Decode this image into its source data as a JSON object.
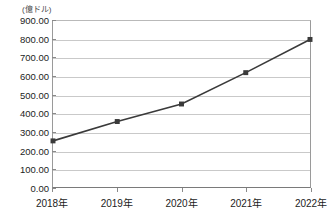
{
  "chart_data": {
    "type": "line",
    "title": "",
    "subtitle": "",
    "xlabel": "",
    "ylabel": "",
    "unit_label": "(億ドル)",
    "categories": [
      "2018年",
      "2019年",
      "2020年",
      "2021年",
      "2022年"
    ],
    "values": [
      250,
      355,
      450,
      620,
      800
    ],
    "series": [
      {
        "name": "",
        "values": [
          250,
          355,
          450,
          620,
          800
        ]
      }
    ],
    "ylim": [
      0,
      900
    ],
    "ytick_labels": [
      "900.00",
      "800.00",
      "700.00",
      "600.00",
      "500.00",
      "400.00",
      "300.00",
      "200.00",
      "100.00",
      "0.00"
    ],
    "ytick_values": [
      900,
      800,
      700,
      600,
      500,
      400,
      300,
      200,
      100,
      0
    ],
    "ytick_step": 100,
    "grid": true,
    "grid_axis": "y",
    "legend": false,
    "legend_position": "none",
    "marker": "square",
    "colors": {
      "line": "#3a3a3a",
      "marker": "#3a3a3a",
      "grid": "#c9c9c9",
      "axis": "#8a8a8a",
      "text": "#1c1c1c",
      "background": "#ffffff"
    }
  }
}
